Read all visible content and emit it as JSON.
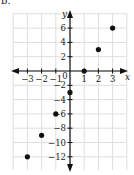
{
  "problem_label": "b.",
  "chart_data": {
    "type": "scatter",
    "title": "",
    "xlabel": "x",
    "ylabel": "y",
    "xlim": [
      -4,
      4
    ],
    "ylim": [
      -14,
      8
    ],
    "grid": true,
    "x_ticks": [
      -3,
      -2,
      -1,
      0,
      1,
      2,
      3
    ],
    "y_ticks": [
      6,
      4,
      2,
      -2,
      -4,
      -6,
      -8,
      -10,
      -12
    ],
    "x_tick_labels": [
      "−3",
      "−2",
      "−1",
      "0",
      "1",
      "2",
      "3"
    ],
    "y_tick_labels": [
      "6",
      "4",
      "2",
      "−2",
      "−4",
      "−6",
      "−8",
      "−10",
      "−12"
    ],
    "series": [
      {
        "name": "points",
        "x": [
          -3,
          -2,
          -1,
          0,
          1,
          2,
          3
        ],
        "y": [
          -12,
          -9,
          -6,
          -3,
          0,
          3,
          6
        ]
      }
    ]
  }
}
